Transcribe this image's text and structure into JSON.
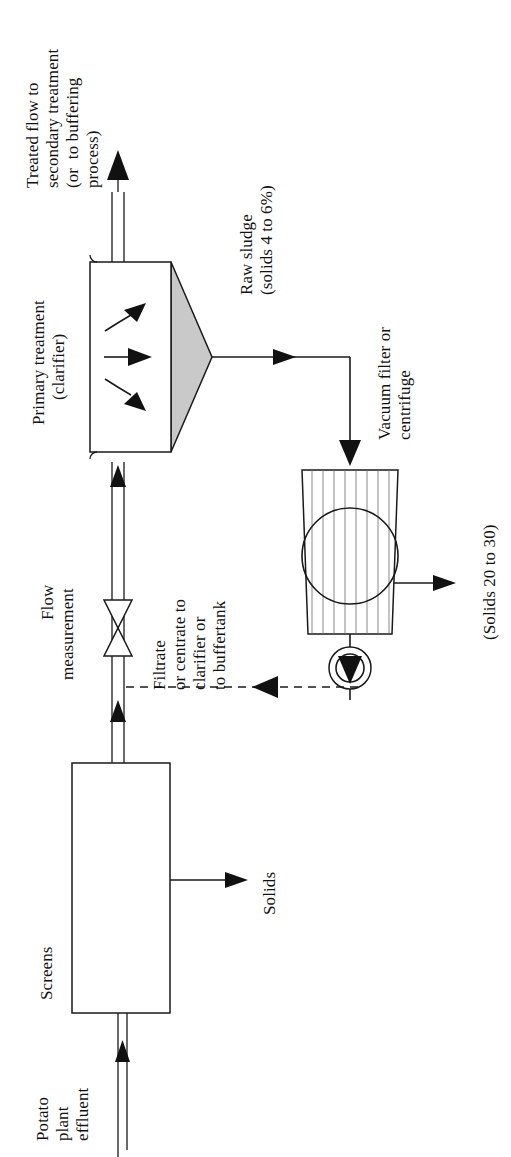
{
  "diagram": {
    "orientation": "rotated-90-ccw",
    "colors": {
      "line": "#1a1a1a",
      "cone_fill": "#c9c9c9",
      "hatch": "#6a6a6a",
      "background": "#ffffff"
    },
    "labels": {
      "treated_flow": {
        "lines": [
          "Treated flow to",
          "secondary treatment",
          "(or  to buffering",
          "process)"
        ]
      },
      "primary_treatment": {
        "lines": [
          "Primary treatment",
          "(clarifier)"
        ]
      },
      "raw_sludge": {
        "lines": [
          "Raw sludge",
          "(solids 4 to 6%)"
        ]
      },
      "vacuum_filter": {
        "lines": [
          "Vacuum filter or",
          "centrifuge"
        ]
      },
      "flow_measurement": {
        "lines": [
          "Flow",
          "measurement"
        ]
      },
      "filtrate": {
        "lines": [
          "Filtrate",
          "or centrate to",
          "clarifier or",
          "to buffertank"
        ]
      },
      "solids_out": {
        "lines": [
          "(Solids 20 to 30)"
        ]
      },
      "screens": {
        "lines": [
          "Screens"
        ]
      },
      "solids": {
        "lines": [
          "Solids"
        ]
      },
      "potato_plant_effluent": {
        "lines": [
          "Potato",
          "plant",
          "effluent"
        ]
      }
    },
    "nodes": [
      {
        "id": "screens",
        "name": "Screens",
        "shape": "rectangle"
      },
      {
        "id": "clarifier",
        "name": "Primary treatment (clarifier)",
        "shape": "rectangle-with-cone"
      },
      {
        "id": "filter",
        "name": "Vacuum filter or centrifuge",
        "shape": "tapered-box-with-drum"
      },
      {
        "id": "flow-meter",
        "name": "Flow measurement",
        "shape": "bowtie-valve"
      },
      {
        "id": "pump",
        "name": "Pump",
        "shape": "circle-with-triangle"
      }
    ],
    "streams": [
      {
        "id": "influent",
        "from": "source",
        "to": "screens",
        "label": "Potato plant effluent",
        "style": "double-line"
      },
      {
        "id": "screened",
        "from": "screens",
        "to": "clarifier",
        "label": "Flow measurement",
        "style": "double-line"
      },
      {
        "id": "screen-solids",
        "from": "screens",
        "to": "sink",
        "label": "Solids",
        "style": "single-line"
      },
      {
        "id": "treated",
        "from": "clarifier",
        "to": "sink",
        "label": "Treated flow to secondary treatment (or to buffering process)",
        "style": "double-line"
      },
      {
        "id": "sludge",
        "from": "clarifier",
        "to": "filter",
        "label": "Raw sludge (solids 4 to 6%)",
        "style": "single-line"
      },
      {
        "id": "cake",
        "from": "filter",
        "to": "sink",
        "label": "(Solids 20 to 30)",
        "style": "single-line"
      },
      {
        "id": "filtrate",
        "from": "pump",
        "to": "screened",
        "label": "Filtrate or centrate to clarifier or to buffertank",
        "style": "dashed"
      }
    ]
  }
}
